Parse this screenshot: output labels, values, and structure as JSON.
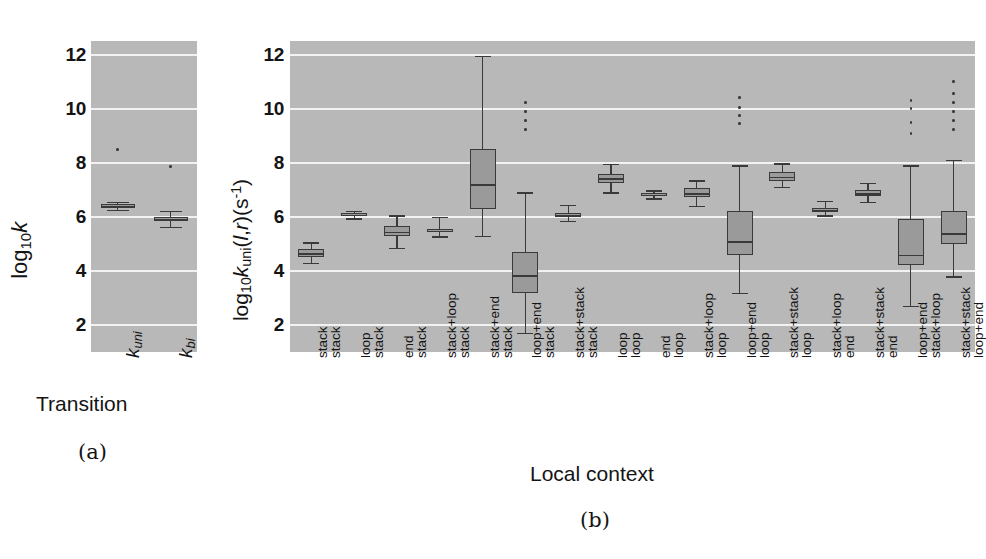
{
  "figure": {
    "panel_a": {
      "caption": "(a)",
      "xaxis_title": "Transition",
      "ylabel_parts": {
        "log": "log",
        "ten": "10",
        "k": "k"
      },
      "yticks": [
        2,
        4,
        6,
        8,
        10,
        12
      ],
      "xticks": [
        "k_uni",
        "k_bi"
      ]
    },
    "panel_b": {
      "caption": "(b)",
      "xaxis_title": "Local context",
      "ylabel_parts": {
        "log": "log",
        "ten": "10",
        "k": "k",
        "uni": "uni",
        "args": "(l,r)(s",
        "exp": "-1",
        "close": ")"
      },
      "yticks": [
        2,
        4,
        6,
        8,
        10,
        12
      ]
    }
  },
  "chart_data": [
    {
      "type": "box",
      "panel": "a",
      "title": "",
      "xlabel": "Transition",
      "ylabel": "log10 k",
      "ylim": [
        1.0,
        12.5
      ],
      "grid": true,
      "categories": [
        "kuni",
        "kbi"
      ],
      "category_labels_html": [
        "k<sub>uni</sub>",
        "k<sub>bi</sub>"
      ],
      "boxes": [
        {
          "label": "kuni",
          "whisker_low": 6.25,
          "q1": 6.33,
          "median": 6.4,
          "q3": 6.47,
          "whisker_high": 6.55,
          "outliers": [
            8.55
          ]
        },
        {
          "label": "kbi",
          "whisker_low": 5.62,
          "q1": 5.83,
          "median": 5.92,
          "q3": 6.0,
          "whisker_high": 6.22,
          "outliers": [
            7.9
          ]
        }
      ]
    },
    {
      "type": "box",
      "panel": "b",
      "title": "",
      "xlabel": "Local context",
      "ylabel": "log10 kuni(l,r)(s^-1)",
      "ylim": [
        1.0,
        12.5
      ],
      "grid": true,
      "categories": [
        "stack stack",
        "loop stack",
        "end stack",
        "stack+loop stack",
        "stack+end stack",
        "loop+end stack",
        "stack+stack stack",
        "loop loop",
        "end loop",
        "stack+loop loop",
        "loop+end loop",
        "stack+stack loop",
        "stack+loop end",
        "stack+stack end",
        "loop+end stack+loop",
        "stack+stack loop+end"
      ],
      "category_lines": [
        [
          "stack",
          "stack"
        ],
        [
          "loop",
          "stack"
        ],
        [
          "end",
          "stack"
        ],
        [
          "stack+loop",
          "stack"
        ],
        [
          "stack+end",
          "stack"
        ],
        [
          "loop+end",
          "stack"
        ],
        [
          "stack+stack",
          "stack"
        ],
        [
          "loop",
          "loop"
        ],
        [
          "end",
          "loop"
        ],
        [
          "stack+loop",
          "loop"
        ],
        [
          "loop+end",
          "loop"
        ],
        [
          "stack+stack",
          "loop"
        ],
        [
          "stack+loop",
          "end"
        ],
        [
          "stack+stack",
          "end"
        ],
        [
          "loop+end",
          "stack+loop"
        ],
        [
          "stack+stack",
          "loop+end"
        ]
      ],
      "boxes": [
        {
          "label": "stack stack",
          "whisker_low": 4.3,
          "q1": 4.52,
          "median": 4.65,
          "q3": 4.8,
          "whisker_high": 5.05,
          "outliers": []
        },
        {
          "label": "loop stack",
          "whisker_low": 5.95,
          "q1": 6.03,
          "median": 6.08,
          "q3": 6.14,
          "whisker_high": 6.22,
          "outliers": []
        },
        {
          "label": "end stack",
          "whisker_low": 4.85,
          "q1": 5.28,
          "median": 5.45,
          "q3": 5.65,
          "whisker_high": 6.05,
          "outliers": []
        },
        {
          "label": "stack+loop stack",
          "whisker_low": 5.28,
          "q1": 5.42,
          "median": 5.48,
          "q3": 5.56,
          "whisker_high": 6.0,
          "outliers": []
        },
        {
          "label": "stack+end stack",
          "whisker_low": 5.3,
          "q1": 6.3,
          "median": 7.2,
          "q3": 8.5,
          "whisker_high": 11.95,
          "outliers": []
        },
        {
          "label": "loop+end stack",
          "whisker_low": 1.7,
          "q1": 3.2,
          "median": 3.85,
          "q3": 4.7,
          "whisker_high": 6.9,
          "outliers": [
            9.3,
            9.62,
            9.95,
            10.28
          ]
        },
        {
          "label": "stack+stack stack",
          "whisker_low": 5.85,
          "q1": 6.0,
          "median": 6.08,
          "q3": 6.15,
          "whisker_high": 6.45,
          "outliers": []
        },
        {
          "label": "loop loop",
          "whisker_low": 6.9,
          "q1": 7.25,
          "median": 7.42,
          "q3": 7.6,
          "whisker_high": 7.95,
          "outliers": []
        },
        {
          "label": "end loop",
          "whisker_low": 6.68,
          "q1": 6.78,
          "median": 6.82,
          "q3": 6.88,
          "whisker_high": 6.98,
          "outliers": []
        },
        {
          "label": "stack+loop loop",
          "whisker_low": 6.4,
          "q1": 6.72,
          "median": 6.88,
          "q3": 7.05,
          "whisker_high": 7.35,
          "outliers": []
        },
        {
          "label": "loop+end loop",
          "whisker_low": 3.2,
          "q1": 4.6,
          "median": 5.1,
          "q3": 6.2,
          "whisker_high": 7.9,
          "outliers": [
            9.5,
            9.8,
            10.1,
            10.45
          ]
        },
        {
          "label": "stack+stack loop",
          "whisker_low": 7.1,
          "q1": 7.33,
          "median": 7.48,
          "q3": 7.65,
          "whisker_high": 7.98,
          "outliers": []
        },
        {
          "label": "stack+loop end",
          "whisker_low": 6.05,
          "q1": 6.18,
          "median": 6.24,
          "q3": 6.32,
          "whisker_high": 6.58,
          "outliers": []
        },
        {
          "label": "stack+stack end",
          "whisker_low": 6.55,
          "q1": 6.78,
          "median": 6.88,
          "q3": 6.98,
          "whisker_high": 7.25,
          "outliers": []
        },
        {
          "label": "loop+end stack+loop",
          "whisker_low": 2.7,
          "q1": 4.2,
          "median": 4.6,
          "q3": 5.9,
          "whisker_high": 7.9,
          "outliers": [
            9.15,
            9.55,
            10.05,
            10.35
          ]
        },
        {
          "label": "stack+stack loop+end",
          "whisker_low": 3.8,
          "q1": 5.0,
          "median": 5.4,
          "q3": 6.2,
          "whisker_high": 8.1,
          "outliers": [
            9.3,
            9.62,
            9.95,
            10.28,
            10.6,
            11.05
          ]
        }
      ]
    }
  ],
  "colors": {
    "plot_background": "#b8b8b8",
    "gridline": "#f2f2f2",
    "box_fill": "#9a9a9a",
    "box_edge": "#3a3a3a",
    "text": "#141414"
  }
}
